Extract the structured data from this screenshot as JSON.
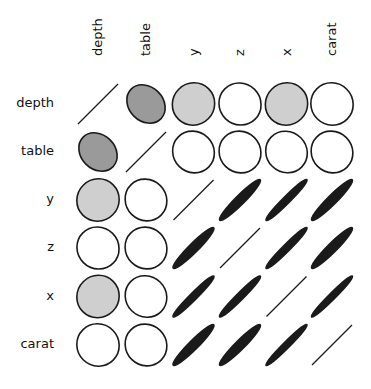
{
  "chart_data": {
    "type": "heatmap",
    "subtype": "correlation-ellipse-matrix",
    "title": "",
    "variables": [
      "depth",
      "table",
      "y",
      "z",
      "x",
      "carat"
    ],
    "column_labels": [
      "depth",
      "table",
      "y",
      "z",
      "x",
      "carat"
    ],
    "row_labels": [
      "depth",
      "table",
      "y",
      "z",
      "x",
      "carat"
    ],
    "matrix": [
      [
        1.0,
        -0.3,
        -0.03,
        0.09,
        -0.03,
        0.03
      ],
      [
        -0.3,
        1.0,
        0.18,
        0.15,
        0.2,
        0.18
      ],
      [
        -0.03,
        0.18,
        1.0,
        0.95,
        0.97,
        0.95
      ],
      [
        0.09,
        0.15,
        0.95,
        1.0,
        0.97,
        0.95
      ],
      [
        -0.03,
        0.2,
        0.97,
        0.97,
        1.0,
        0.98
      ],
      [
        0.03,
        0.18,
        0.95,
        0.95,
        0.98,
        1.0
      ]
    ],
    "encoding": {
      "shape": "ellipse eccentricity and tilt reflect correlation magnitude and sign; diagonal drawn as line",
      "fill_positive_strong": "#1a1a1a",
      "fill_negative_moderate": "#9a9a9a",
      "fill_negative_weak": "#cfcfcf",
      "fill_near_zero_positive": "#ffffff",
      "stroke": "#1a1a1a"
    },
    "legend": null,
    "grid": false
  }
}
